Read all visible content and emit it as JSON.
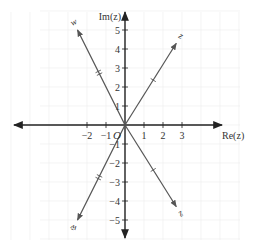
{
  "diagram": {
    "type": "complex-plane-argand",
    "axes": {
      "x_label": "Re(z)",
      "y_label": "Im(z)",
      "origin_label": "O",
      "x_ticks": [
        -2,
        -1,
        1,
        2,
        3
      ],
      "x_tick_labels": [
        "−2",
        "−1",
        "1",
        "2",
        "3"
      ],
      "y_ticks": [
        5,
        4,
        3,
        2,
        1,
        -1,
        -2,
        -3,
        -4,
        -5
      ],
      "y_tick_labels": [
        "5",
        "4",
        "3",
        "2",
        "1",
        "−1",
        "−2",
        "−3",
        "−4",
        "−5"
      ]
    },
    "vectors": [
      {
        "name": "vector-upper-left",
        "label": "w",
        "end": [
          -2.5,
          5
        ],
        "mark": "double-tick"
      },
      {
        "name": "vector-upper-right",
        "label": "z",
        "end": [
          2.7,
          4.3
        ],
        "mark": "single-tick"
      },
      {
        "name": "vector-lower-left",
        "label": "w̄",
        "end": [
          -2.5,
          -5
        ],
        "mark": "double-tick"
      },
      {
        "name": "vector-lower-right",
        "label": "z̄",
        "end": [
          2.7,
          -4.3
        ],
        "mark": "single-tick"
      }
    ],
    "colors": {
      "axis": "#222222",
      "vector": "#555555",
      "grid": "#ececec",
      "text": "#333333"
    }
  }
}
